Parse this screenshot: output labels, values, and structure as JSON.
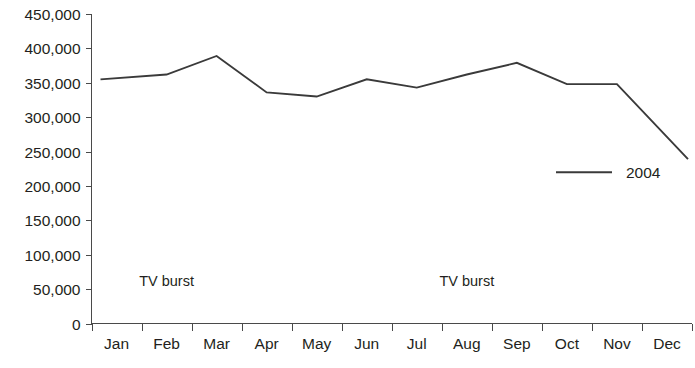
{
  "chart_data": {
    "type": "line",
    "title": "",
    "subtitle": "",
    "xlabel": "",
    "ylabel": "",
    "categories": [
      "Jan",
      "Feb",
      "Mar",
      "Apr",
      "May",
      "Jun",
      "Jul",
      "Aug",
      "Sep",
      "Oct",
      "Nov",
      "Dec"
    ],
    "series": [
      {
        "name": "2004",
        "color": "#3a3a3a",
        "values": [
          355000,
          362000,
          389000,
          336000,
          330000,
          355000,
          343000,
          362000,
          379000,
          348000,
          348000,
          239000
        ]
      }
    ],
    "ylim": [
      0,
      450000
    ],
    "ytick_values": [
      0,
      50000,
      100000,
      150000,
      200000,
      250000,
      300000,
      350000,
      400000,
      450000
    ],
    "ytick_labels": [
      "0",
      "50,000",
      "100,000",
      "150,000",
      "200,000",
      "250,000",
      "300,000",
      "350,000",
      "400,000",
      "450,000"
    ],
    "grid": false,
    "legend_position": "center-right",
    "legend_entries": [
      {
        "label": "2004",
        "color": "#3a3a3a",
        "marker": "line"
      }
    ],
    "annotations": [
      {
        "text": "TV burst",
        "near_category": "Feb",
        "value_position": 55000
      },
      {
        "text": "TV burst",
        "near_category": "Aug",
        "value_position": 55000
      }
    ]
  },
  "axes": {
    "y_axis_name": "y-axis",
    "x_axis_name": "x-axis"
  },
  "colors": {
    "series_2004": "#3a3a3a",
    "axis": "#4a4a4a",
    "text": "#231f20",
    "background": "#ffffff"
  }
}
